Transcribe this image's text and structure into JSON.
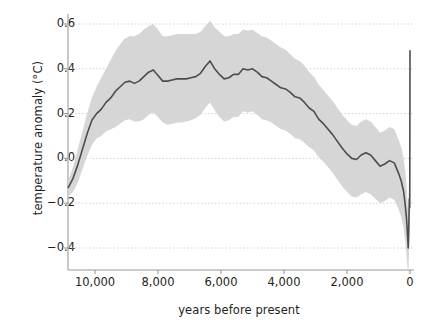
{
  "chart_data": {
    "type": "line",
    "title": "",
    "subtitle": "",
    "xlabel": "years before present",
    "ylabel": "temperature anomaly (°C)",
    "xlim": [
      10850,
      0
    ],
    "ylim": [
      -0.52,
      0.66
    ],
    "x_inverted": true,
    "grid": "horizontal-dotted",
    "legend": null,
    "legend_position": "none",
    "xticks": [
      10000,
      8000,
      6000,
      4000,
      2000,
      0
    ],
    "xtick_labels": [
      "10,000",
      "8,000",
      "6,000",
      "4,000",
      "2,000",
      "0"
    ],
    "yticks": [
      0.6,
      0.4,
      0.2,
      0.0,
      -0.2,
      -0.4
    ],
    "ytick_labels": [
      "0.6",
      "0.4",
      "0.2",
      "0.0",
      "−0.2",
      "−0.4"
    ],
    "x": [
      10850,
      10700,
      10550,
      10400,
      10250,
      10100,
      9950,
      9800,
      9650,
      9500,
      9350,
      9200,
      9050,
      8900,
      8750,
      8600,
      8450,
      8300,
      8150,
      8000,
      7850,
      7700,
      7550,
      7400,
      7250,
      7100,
      6950,
      6800,
      6650,
      6500,
      6350,
      6200,
      6050,
      5900,
      5750,
      5600,
      5450,
      5300,
      5150,
      5000,
      4850,
      4700,
      4550,
      4400,
      4250,
      4100,
      3950,
      3800,
      3650,
      3500,
      3350,
      3200,
      3050,
      2900,
      2750,
      2600,
      2450,
      2300,
      2150,
      2000,
      1850,
      1700,
      1550,
      1400,
      1250,
      1100,
      950,
      800,
      650,
      500,
      380,
      280,
      200,
      150,
      110,
      80,
      55,
      35,
      20,
      8,
      0
    ],
    "series": [
      {
        "name": "temperature anomaly",
        "color": "#4d4d4d",
        "values": [
          -0.13,
          -0.09,
          -0.03,
          0.04,
          0.11,
          0.17,
          0.2,
          0.22,
          0.25,
          0.27,
          0.3,
          0.32,
          0.34,
          0.345,
          0.335,
          0.345,
          0.365,
          0.385,
          0.395,
          0.37,
          0.345,
          0.345,
          0.35,
          0.355,
          0.355,
          0.355,
          0.36,
          0.365,
          0.38,
          0.41,
          0.435,
          0.4,
          0.375,
          0.355,
          0.36,
          0.375,
          0.375,
          0.4,
          0.395,
          0.4,
          0.385,
          0.365,
          0.36,
          0.345,
          0.33,
          0.315,
          0.31,
          0.295,
          0.275,
          0.27,
          0.25,
          0.225,
          0.21,
          0.175,
          0.155,
          0.13,
          0.105,
          0.075,
          0.045,
          0.02,
          0.0,
          -0.005,
          0.015,
          0.025,
          0.015,
          -0.01,
          -0.035,
          -0.025,
          -0.01,
          -0.02,
          -0.06,
          -0.1,
          -0.15,
          -0.21,
          -0.27,
          -0.34,
          -0.4,
          -0.28,
          -0.18,
          -0.22,
          0.48
        ]
      }
    ],
    "uncertainty_band": {
      "name": "uncertainty envelope",
      "color": "#d4d4d4",
      "upper": [
        -0.1,
        -0.04,
        0.04,
        0.12,
        0.2,
        0.27,
        0.32,
        0.36,
        0.4,
        0.44,
        0.48,
        0.51,
        0.535,
        0.545,
        0.545,
        0.555,
        0.575,
        0.59,
        0.6,
        0.575,
        0.545,
        0.545,
        0.55,
        0.555,
        0.555,
        0.555,
        0.555,
        0.555,
        0.565,
        0.59,
        0.615,
        0.585,
        0.565,
        0.545,
        0.545,
        0.555,
        0.555,
        0.575,
        0.57,
        0.575,
        0.56,
        0.545,
        0.54,
        0.525,
        0.51,
        0.495,
        0.485,
        0.465,
        0.445,
        0.435,
        0.415,
        0.385,
        0.365,
        0.33,
        0.305,
        0.28,
        0.255,
        0.225,
        0.195,
        0.17,
        0.15,
        0.145,
        0.165,
        0.175,
        0.165,
        0.14,
        0.115,
        0.125,
        0.14,
        0.13,
        0.09,
        0.05,
        0.0,
        -0.06,
        -0.12,
        -0.19,
        -0.25,
        -0.13,
        -0.03,
        -0.07,
        0.48
      ],
      "lower": [
        -0.17,
        -0.15,
        -0.11,
        -0.05,
        0.01,
        0.06,
        0.09,
        0.1,
        0.12,
        0.13,
        0.14,
        0.155,
        0.17,
        0.175,
        0.165,
        0.165,
        0.175,
        0.195,
        0.205,
        0.185,
        0.16,
        0.15,
        0.155,
        0.16,
        0.16,
        0.165,
        0.17,
        0.18,
        0.195,
        0.225,
        0.25,
        0.215,
        0.185,
        0.165,
        0.17,
        0.185,
        0.185,
        0.21,
        0.205,
        0.21,
        0.195,
        0.175,
        0.17,
        0.16,
        0.145,
        0.13,
        0.125,
        0.11,
        0.09,
        0.085,
        0.07,
        0.05,
        0.035,
        0.005,
        -0.015,
        -0.04,
        -0.065,
        -0.095,
        -0.125,
        -0.15,
        -0.17,
        -0.175,
        -0.16,
        -0.15,
        -0.16,
        -0.18,
        -0.2,
        -0.19,
        -0.175,
        -0.185,
        -0.22,
        -0.26,
        -0.31,
        -0.37,
        -0.43,
        -0.49,
        -0.52,
        -0.44,
        -0.35,
        -0.39,
        0.48
      ]
    }
  },
  "axes": {
    "ylabel_text": "temperature anomaly (°C)",
    "xlabel_text": "years before present"
  }
}
